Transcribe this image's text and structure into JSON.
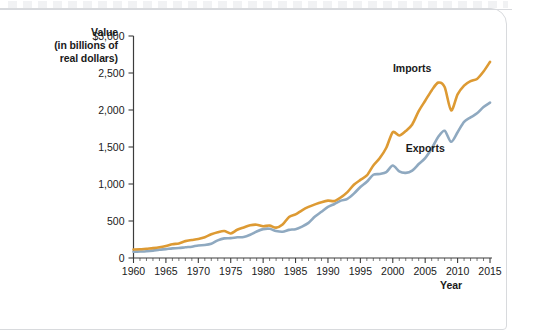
{
  "axes": {
    "y_title_lines": [
      "Value",
      "(in billions of",
      "real dollars)"
    ],
    "x_title": "Year"
  },
  "chart_data": {
    "type": "line",
    "title": "",
    "subtitle": "",
    "xlabel": "Year",
    "ylabel": "Value (in billions of real dollars)",
    "xlim": [
      1960,
      2015
    ],
    "ylim": [
      0,
      3000
    ],
    "grid": false,
    "legend_position": "inline-annotations",
    "y_ticks": [
      0,
      500,
      1000,
      1500,
      2000,
      2500,
      3000
    ],
    "y_tick_labels": [
      "0",
      "500",
      "1,000",
      "1,500",
      "2,000",
      "2,500",
      "$3,000"
    ],
    "x_ticks": [
      1960,
      1965,
      1970,
      1975,
      1980,
      1985,
      1990,
      1995,
      2000,
      2005,
      2010,
      2015
    ],
    "x_tick_labels": [
      "1960",
      "1965",
      "1970",
      "1975",
      "1980",
      "1985",
      "1990",
      "1995",
      "2000",
      "2005",
      "2010",
      "2015"
    ],
    "x_minor_tick_step": 1,
    "colors": {
      "imports": "#DD9A33",
      "exports": "#8FA9C0",
      "axis": "#3c3c3c",
      "text": "#1a1a1a",
      "background": "#ffffff",
      "card_border": "#d8dadd"
    },
    "x": [
      1960,
      1961,
      1962,
      1963,
      1964,
      1965,
      1966,
      1967,
      1968,
      1969,
      1970,
      1971,
      1972,
      1973,
      1974,
      1975,
      1976,
      1977,
      1978,
      1979,
      1980,
      1981,
      1982,
      1983,
      1984,
      1985,
      1986,
      1987,
      1988,
      1989,
      1990,
      1991,
      1992,
      1993,
      1994,
      1995,
      1996,
      1997,
      1998,
      1999,
      2000,
      2001,
      2002,
      2003,
      2004,
      2005,
      2006,
      2007,
      2008,
      2009,
      2010,
      2011,
      2012,
      2013,
      2014,
      2015
    ],
    "series": [
      {
        "name": "Imports",
        "color": "#DD9A33",
        "label_anchor_year": 2003,
        "label_anchor_value": 2520,
        "values": [
          115,
          118,
          126,
          133,
          144,
          162,
          186,
          197,
          228,
          243,
          258,
          281,
          320,
          348,
          364,
          332,
          381,
          412,
          442,
          450,
          430,
          438,
          410,
          452,
          555,
          590,
          645,
          690,
          725,
          755,
          775,
          770,
          820,
          890,
          990,
          1055,
          1115,
          1250,
          1350,
          1490,
          1700,
          1655,
          1715,
          1805,
          1985,
          2125,
          2265,
          2370,
          2310,
          1995,
          2210,
          2330,
          2390,
          2420,
          2520,
          2650
        ]
      },
      {
        "name": "Exports",
        "color": "#8FA9C0",
        "label_anchor_year": 2005,
        "label_anchor_value": 1430,
        "values": [
          85,
          88,
          92,
          100,
          113,
          120,
          130,
          134,
          145,
          153,
          170,
          175,
          192,
          238,
          265,
          268,
          280,
          285,
          315,
          358,
          390,
          395,
          365,
          355,
          380,
          390,
          425,
          475,
          560,
          625,
          690,
          730,
          775,
          800,
          870,
          960,
          1030,
          1125,
          1135,
          1160,
          1250,
          1170,
          1150,
          1180,
          1270,
          1350,
          1480,
          1635,
          1720,
          1570,
          1700,
          1840,
          1900,
          1955,
          2040,
          2100
        ]
      }
    ],
    "annotations": [
      {
        "text": "Imports",
        "series": "Imports"
      },
      {
        "text": "Exports",
        "series": "Exports"
      }
    ]
  }
}
